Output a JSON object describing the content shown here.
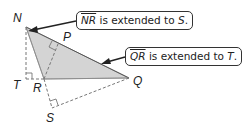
{
  "diagram": {
    "points": {
      "N": {
        "label": "N",
        "x": 26,
        "y": 27
      },
      "P": {
        "label": "P",
        "x": 58,
        "y": 44
      },
      "Q": {
        "label": "Q",
        "x": 129,
        "y": 78
      },
      "R": {
        "label": "R",
        "x": 44,
        "y": 79
      },
      "T": {
        "label": "T",
        "x": 26,
        "y": 79
      },
      "S": {
        "label": "S",
        "x": 52,
        "y": 108
      }
    },
    "triangle_fill": "#d4d4d4",
    "line_color": "#6a6a6a"
  },
  "callouts": [
    {
      "segment": "NR",
      "text": " is extended to ",
      "target": "S",
      "end": "."
    },
    {
      "segment": "QR",
      "text": " is extended to ",
      "target": "T",
      "end": "."
    }
  ]
}
